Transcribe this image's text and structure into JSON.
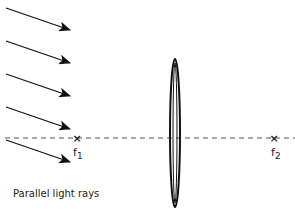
{
  "diagram": {
    "type": "optics-convex-lens",
    "caption": "Parallel light rays",
    "focal_points": [
      {
        "id": "f1",
        "label": "f",
        "subscript": "1",
        "x": 77,
        "y": 138
      },
      {
        "id": "f2",
        "label": "f",
        "subscript": "2",
        "x": 274,
        "y": 138
      }
    ],
    "optical_axis": {
      "y": 138,
      "x_start": 5,
      "x_end": 295,
      "style": "dashed"
    },
    "lens": {
      "cx": 175,
      "cy": 133,
      "rx": 5,
      "ry": 74
    },
    "rays": [
      {
        "x1": 6,
        "y1": 8,
        "x2": 70,
        "y2": 30
      },
      {
        "x1": 6,
        "y1": 41,
        "x2": 70,
        "y2": 63
      },
      {
        "x1": 6,
        "y1": 74,
        "x2": 70,
        "y2": 96
      },
      {
        "x1": 6,
        "y1": 107,
        "x2": 70,
        "y2": 129
      },
      {
        "x1": 6,
        "y1": 140,
        "x2": 70,
        "y2": 162
      }
    ],
    "colors": {
      "stroke": "#111111",
      "axis": "#555555"
    }
  }
}
